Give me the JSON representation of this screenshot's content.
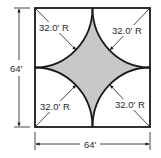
{
  "diagram": {
    "square": {
      "width_label": "64'",
      "height_label": "64'"
    },
    "radius_labels": {
      "top_left": "32.0' R",
      "top_right": "32.0' R",
      "bottom_left": "32.0' R",
      "bottom_right": "32.0' R"
    },
    "colors": {
      "outline": "#1a1a1a",
      "shaded_region": "#c8c8c8",
      "background": "#ffffff"
    }
  }
}
